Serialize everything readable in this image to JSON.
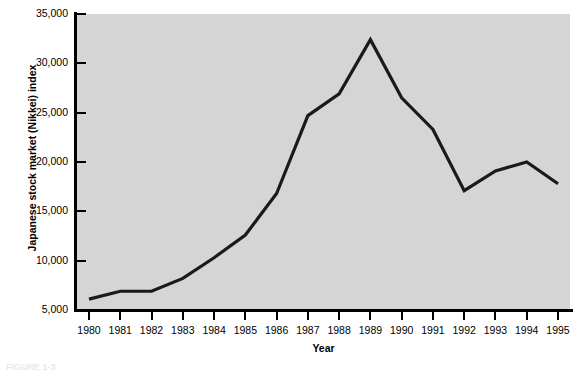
{
  "chart_data": {
    "type": "line",
    "title": "",
    "xlabel": "Year",
    "ylabel": "Japanese stock market (Nikkei) index",
    "categories": [
      1980,
      1981,
      1982,
      1983,
      1984,
      1985,
      1986,
      1987,
      1988,
      1989,
      1990,
      1991,
      1992,
      1993,
      1994,
      1995
    ],
    "x_tick_labels": [
      "1980",
      "1981",
      "1982",
      "1983",
      "1984",
      "1985",
      "1986",
      "1987",
      "1988",
      "1989",
      "1990",
      "1991",
      "1992",
      "1993",
      "1994",
      "1995"
    ],
    "values": [
      6100,
      6900,
      6900,
      8200,
      10300,
      12600,
      16800,
      24700,
      26900,
      32400,
      26500,
      23300,
      17100,
      19100,
      20000,
      17800
    ],
    "series": [
      {
        "name": "Japanese stock market (Nikkei) index",
        "values": [
          6100,
          6900,
          6900,
          8200,
          10300,
          12600,
          16800,
          24700,
          26900,
          32400,
          26500,
          23300,
          17100,
          19100,
          20000,
          17800
        ]
      }
    ],
    "y_tick_labels": [
      "5,000",
      "10,000",
      "15,000",
      "20,000",
      "25,000",
      "30,000",
      "35,000"
    ],
    "y_tick_values": [
      5000,
      10000,
      15000,
      20000,
      25000,
      30000,
      35000
    ],
    "ylim": [
      5000,
      35000
    ],
    "xlim": [
      1980,
      1995
    ],
    "grid": false,
    "legend": false,
    "legend_position": "none",
    "line_color": "#1a1a1a",
    "plot_background_color": "#d5d5d5",
    "figure_background_color": "#ffffff",
    "axis_color": "#000000",
    "annotations": []
  },
  "figure": {
    "caption": "FIGURE 1-3"
  }
}
